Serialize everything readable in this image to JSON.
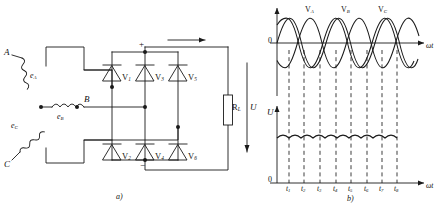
{
  "figure": {
    "type": "three-phase-bridge-rectifier",
    "panels": [
      {
        "id": "a",
        "caption": "a)",
        "title": "three-phase bridge rectifier circuit"
      },
      {
        "id": "b",
        "caption": "b)",
        "title": "voltage waveforms"
      }
    ]
  },
  "circuit": {
    "source": {
      "connection": "wye",
      "terminals": [
        {
          "name": "phase-a-terminal",
          "label": "A"
        },
        {
          "name": "phase-b-terminal",
          "label": "B"
        },
        {
          "name": "phase-c-terminal",
          "label": "C"
        }
      ],
      "emfs": [
        {
          "name": "emf-a",
          "base": "e",
          "sub": "A"
        },
        {
          "name": "emf-b",
          "base": "e",
          "sub": "B"
        },
        {
          "name": "emf-c",
          "base": "e",
          "sub": "C"
        }
      ]
    },
    "diodes": {
      "upper_group": [
        {
          "name": "diode-v1",
          "base": "V",
          "sub": "1"
        },
        {
          "name": "diode-v3",
          "base": "V",
          "sub": "3"
        },
        {
          "name": "diode-v5",
          "base": "V",
          "sub": "5"
        }
      ],
      "lower_group": [
        {
          "name": "diode-v2",
          "base": "V",
          "sub": "2"
        },
        {
          "name": "diode-v4",
          "base": "V",
          "sub": "4"
        },
        {
          "name": "diode-v6",
          "base": "V",
          "sub": "6"
        }
      ]
    },
    "load": {
      "name": "load-resistor",
      "base": "R",
      "sub": "L",
      "voltage_label": "U"
    },
    "terminals": {
      "positive": "+",
      "negative": "−"
    }
  },
  "chart_data": [
    {
      "id": "ac-waveforms",
      "type": "line",
      "title": "",
      "xlabel": "ωt",
      "ylabel": "",
      "origin_label": "0",
      "grid": false,
      "legend_position": "inline-above-peaks",
      "xlim": [
        0,
        6.9813
      ],
      "ylim": [
        -1.15,
        1.15
      ],
      "x_unit": "radians",
      "series": [
        {
          "name": "V",
          "sub": "A",
          "phase_deg": 0,
          "amplitude": 1.0,
          "label_x_rad": 1.5708
        },
        {
          "name": "V",
          "sub": "B",
          "phase_deg": -120,
          "amplitude": 1.0,
          "label_x_rad": 3.6652
        },
        {
          "name": "V",
          "sub": "C",
          "phase_deg": -240,
          "amplitude": 1.0,
          "label_x_rad": 5.7596
        }
      ],
      "commutation_marks": [
        0.5236,
        1.5708,
        2.618,
        3.6652,
        4.7124,
        5.7596,
        6.8068,
        7.854
      ]
    },
    {
      "id": "rectified-output",
      "type": "line",
      "title": "",
      "xlabel": "ωt",
      "ylabel": "U",
      "origin_label": "0",
      "grid": false,
      "xlim": [
        0,
        6.9813
      ],
      "ylim": [
        0,
        1.25
      ],
      "ripple_count": 8,
      "ripple_mean": 0.955,
      "ripple_peak": 1.0,
      "ripple_trough": 0.866,
      "tick_labels": [
        {
          "base": "t",
          "sub": "1"
        },
        {
          "base": "t",
          "sub": "2"
        },
        {
          "base": "t",
          "sub": "3"
        },
        {
          "base": "t",
          "sub": "4"
        },
        {
          "base": "t",
          "sub": "5"
        },
        {
          "base": "t",
          "sub": "6"
        },
        {
          "base": "t",
          "sub": "7"
        },
        {
          "base": "t",
          "sub": "8"
        }
      ]
    }
  ],
  "colors": {
    "stroke": "#1a1a1a",
    "background": "#ffffff"
  }
}
